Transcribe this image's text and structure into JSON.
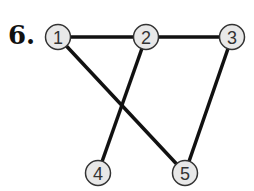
{
  "problem": {
    "number": "6."
  },
  "graph": {
    "nodes": [
      {
        "id": "1",
        "label": "1",
        "x": 58,
        "y": 37
      },
      {
        "id": "2",
        "label": "2",
        "x": 146,
        "y": 37
      },
      {
        "id": "3",
        "label": "3",
        "x": 232,
        "y": 37
      },
      {
        "id": "4",
        "label": "4",
        "x": 98,
        "y": 173
      },
      {
        "id": "5",
        "label": "5",
        "x": 185,
        "y": 173
      }
    ],
    "edges": [
      {
        "from": "1",
        "to": "2"
      },
      {
        "from": "2",
        "to": "3"
      },
      {
        "from": "1",
        "to": "5"
      },
      {
        "from": "2",
        "to": "4"
      },
      {
        "from": "3",
        "to": "5"
      }
    ],
    "node_fill": "#e8e8e8",
    "node_stroke": "#333333",
    "edge_color": "#111111"
  }
}
